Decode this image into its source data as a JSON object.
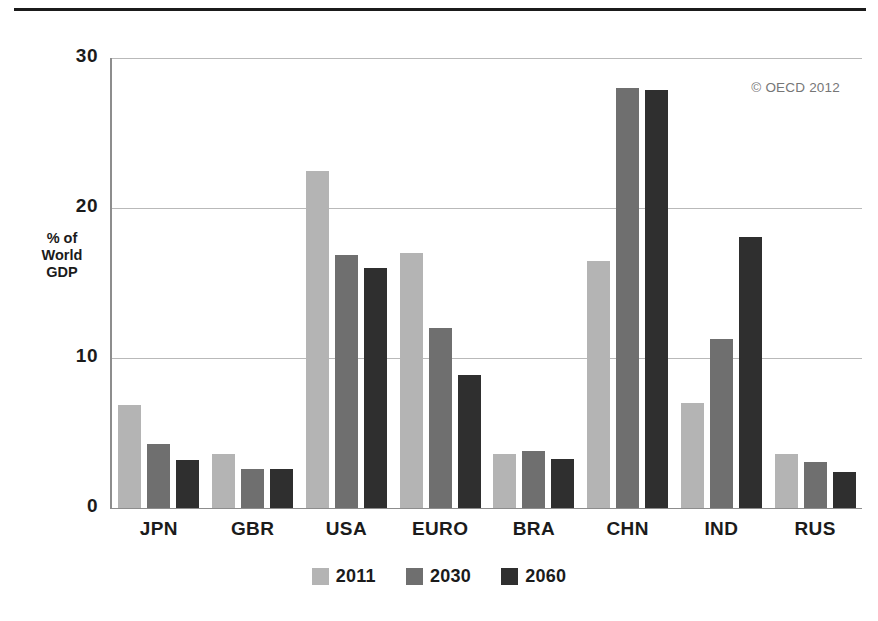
{
  "chart_data": {
    "type": "bar",
    "title": "",
    "xlabel": "",
    "ylabel": "% of World GDP",
    "ylim": [
      0,
      30
    ],
    "yticks": [
      0,
      10,
      20,
      30
    ],
    "ytick_labels": [
      "0",
      "10",
      "20",
      "30"
    ],
    "grid": true,
    "legend_position": "bottom-center",
    "categories": [
      "JPN",
      "GBR",
      "USA",
      "EURO",
      "BRA",
      "CHN",
      "IND",
      "RUS"
    ],
    "series": [
      {
        "name": "2011",
        "color": "#b4b4b4",
        "values": [
          6.9,
          3.6,
          22.5,
          17.0,
          3.6,
          16.5,
          7.0,
          3.6
        ]
      },
      {
        "name": "2030",
        "color": "#6f6f6f",
        "values": [
          4.3,
          2.6,
          16.9,
          12.0,
          3.8,
          28.0,
          11.3,
          3.1
        ]
      },
      {
        "name": "2060",
        "color": "#2f2f2f",
        "values": [
          3.2,
          2.6,
          16.0,
          8.9,
          3.3,
          27.9,
          18.1,
          2.4
        ]
      }
    ],
    "annotations": [
      "© OECD 2012"
    ]
  },
  "axis": {
    "y_title_lines": [
      "% of",
      "World",
      "GDP"
    ]
  },
  "credit": {
    "text": "© OECD 2012"
  }
}
